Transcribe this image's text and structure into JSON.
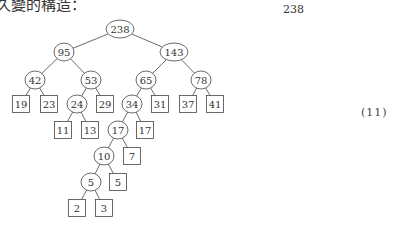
{
  "caption": "久變的構造：",
  "right_number": "238",
  "equation_number": "(11)",
  "tree": {
    "internal_nodes": [
      {
        "id": "n238",
        "label": "238",
        "x": 120,
        "y": 29,
        "rx": 14
      },
      {
        "id": "n95",
        "label": "95",
        "x": 64,
        "y": 52,
        "rx": 10
      },
      {
        "id": "n143",
        "label": "143",
        "x": 174,
        "y": 52,
        "rx": 14
      },
      {
        "id": "n42",
        "label": "42",
        "x": 35,
        "y": 80,
        "rx": 10
      },
      {
        "id": "n53",
        "label": "53",
        "x": 91,
        "y": 80,
        "rx": 10
      },
      {
        "id": "n65",
        "label": "65",
        "x": 146,
        "y": 80,
        "rx": 10
      },
      {
        "id": "n78",
        "label": "78",
        "x": 201,
        "y": 80,
        "rx": 10
      },
      {
        "id": "n24",
        "label": "24",
        "x": 77,
        "y": 104,
        "rx": 10
      },
      {
        "id": "n34",
        "label": "34",
        "x": 132,
        "y": 104,
        "rx": 10
      },
      {
        "id": "n17c",
        "label": "17",
        "x": 118,
        "y": 130,
        "rx": 10
      },
      {
        "id": "n10",
        "label": "10",
        "x": 104,
        "y": 156,
        "rx": 10
      },
      {
        "id": "n5c",
        "label": "5",
        "x": 91,
        "y": 182,
        "rx": 10
      }
    ],
    "leaves": [
      {
        "id": "l19",
        "label": "19",
        "x": 21,
        "y": 104
      },
      {
        "id": "l23",
        "label": "23",
        "x": 49,
        "y": 104
      },
      {
        "id": "l29",
        "label": "29",
        "x": 105,
        "y": 104
      },
      {
        "id": "l31",
        "label": "31",
        "x": 160,
        "y": 104
      },
      {
        "id": "l37",
        "label": "37",
        "x": 188,
        "y": 104
      },
      {
        "id": "l41",
        "label": "41",
        "x": 215,
        "y": 104
      },
      {
        "id": "l11",
        "label": "11",
        "x": 63,
        "y": 130
      },
      {
        "id": "l13",
        "label": "13",
        "x": 90,
        "y": 130
      },
      {
        "id": "l17",
        "label": "17",
        "x": 145,
        "y": 130
      },
      {
        "id": "l7",
        "label": "7",
        "x": 132,
        "y": 156
      },
      {
        "id": "l5",
        "label": "5",
        "x": 118,
        "y": 182
      },
      {
        "id": "l2",
        "label": "2",
        "x": 77,
        "y": 208
      },
      {
        "id": "l3",
        "label": "3",
        "x": 104,
        "y": 208
      }
    ],
    "edges": [
      [
        "n238",
        "n95"
      ],
      [
        "n238",
        "n143"
      ],
      [
        "n95",
        "n42"
      ],
      [
        "n95",
        "n53"
      ],
      [
        "n143",
        "n65"
      ],
      [
        "n143",
        "n78"
      ],
      [
        "n42",
        "l19"
      ],
      [
        "n42",
        "l23"
      ],
      [
        "n53",
        "n24"
      ],
      [
        "n53",
        "l29"
      ],
      [
        "n65",
        "n34"
      ],
      [
        "n65",
        "l31"
      ],
      [
        "n78",
        "l37"
      ],
      [
        "n78",
        "l41"
      ],
      [
        "n24",
        "l11"
      ],
      [
        "n24",
        "l13"
      ],
      [
        "n34",
        "n17c"
      ],
      [
        "n34",
        "l17"
      ],
      [
        "n17c",
        "n10"
      ],
      [
        "n17c",
        "l7"
      ],
      [
        "n10",
        "n5c"
      ],
      [
        "n10",
        "l5"
      ],
      [
        "n5c",
        "l2"
      ],
      [
        "n5c",
        "l3"
      ]
    ]
  }
}
